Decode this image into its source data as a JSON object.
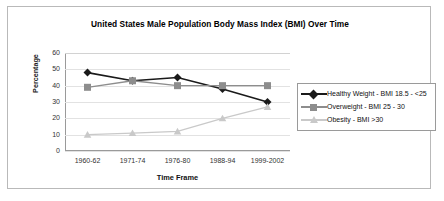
{
  "chart_data": {
    "type": "line",
    "title": "United States Male Population Body Mass Index (BMI) Over Time",
    "xlabel": "Time Frame",
    "ylabel": "Percentage",
    "categories": [
      "1960-62",
      "1971-74",
      "1976-80",
      "1988-94",
      "1999-2002"
    ],
    "ylim": [
      0,
      60
    ],
    "yticks": [
      60,
      50,
      40,
      30,
      20,
      10,
      0
    ],
    "grid": true,
    "legend_position": "right",
    "series": [
      {
        "name": "Healthy Weight - BMI 18.5 - <25",
        "values": [
          48,
          43,
          45,
          38,
          30
        ],
        "color": "#1a1a1a",
        "marker": "diamond"
      },
      {
        "name": "Overweight - BMI 25 - 30",
        "values": [
          39,
          43,
          40,
          40,
          40
        ],
        "color": "#8d8d8d",
        "marker": "square"
      },
      {
        "name": "Obesity - BMI  >30",
        "values": [
          10,
          11,
          12,
          20,
          27
        ],
        "color": "#c9c9c9",
        "marker": "triangle"
      }
    ]
  }
}
